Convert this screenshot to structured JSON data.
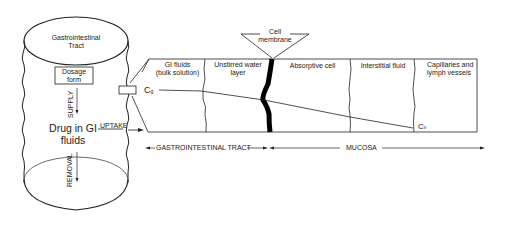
{
  "diagram": {
    "cylinder": {
      "title_line1": "Gastrointestinal",
      "title_line2": "Tract",
      "dosage_line1": "Dosage",
      "dosage_line2": "form",
      "supply_label": "SUPPLY",
      "drug_line1": "Drug in GI",
      "drug_line2": "fluids",
      "removal_label": "REMOVAL",
      "uptake_label": "UPTAKE"
    },
    "callout": {
      "label_line1": "Cell",
      "label_line2": "membrane"
    },
    "compartments": [
      {
        "line1": "GI fluids",
        "line2": "(bulk solution)"
      },
      {
        "line1": "Unstirred water",
        "line2": "layer"
      },
      {
        "line1": "Absorptive cell",
        "line2": ""
      },
      {
        "line1": "Interstitial fluid",
        "line2": ""
      },
      {
        "line1": "Capillaries and",
        "line2": "lymph vessels"
      }
    ],
    "concentrations": {
      "cg": "C",
      "cg_sub": "g",
      "cv": "C",
      "cv_sub": "v"
    },
    "regions": {
      "gi_tract": "GASTROINTESTINAL TRACT",
      "mucosa": "MUCOSA"
    }
  }
}
